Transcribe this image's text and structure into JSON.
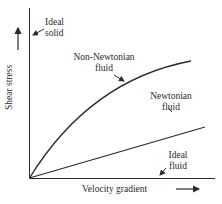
{
  "diagram": {
    "title": "",
    "x_axis": {
      "label": "Velocity gradient",
      "arrow": "right"
    },
    "y_axis": {
      "label": "Shear stress",
      "arrow": "up"
    },
    "curves": [
      {
        "name": "Ideal solid",
        "label_line1": "Ideal",
        "label_line2": "solid",
        "shape": "vertical line along y-axis"
      },
      {
        "name": "Non-Newtonian fluid",
        "label_line1": "Non-Newtonian",
        "label_line2": "fluid",
        "shape": "concave-down curve from origin"
      },
      {
        "name": "Newtonian fluid",
        "label_line1": "Newtonian",
        "label_line2": "fluid",
        "shape": "straight line from origin"
      },
      {
        "name": "Ideal fluid",
        "label_line1": "Ideal",
        "label_line2": "fluid",
        "shape": "horizontal line along x-axis"
      }
    ],
    "colors": {
      "line": "#2a2a2a",
      "background": "#ffffff"
    }
  }
}
